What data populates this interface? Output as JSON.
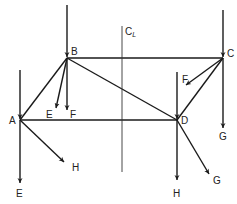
{
  "diagram": {
    "nodes": {
      "A": {
        "label": "A",
        "x": 20,
        "y": 120
      },
      "B": {
        "label": "B",
        "x": 67,
        "y": 58
      },
      "C": {
        "label": "C",
        "x": 223,
        "y": 58
      },
      "D": {
        "label": "D",
        "x": 177,
        "y": 120
      }
    },
    "centerline": {
      "label": "C",
      "subscript": "L"
    },
    "force_labels": {
      "B_E": "E",
      "B_F": "F",
      "C_F": "F",
      "C_G": "G",
      "A_E": "E",
      "A_H": "H",
      "D_H": "H",
      "D_G": "G"
    },
    "colors": {
      "line": "#1a1a1a",
      "text": "#222222",
      "background": "#ffffff"
    }
  }
}
